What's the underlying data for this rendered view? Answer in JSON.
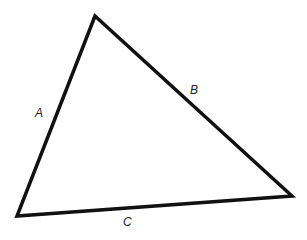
{
  "diagram": {
    "type": "triangle",
    "stroke_color": "#111111",
    "vertices": {
      "top": [
        95,
        16
      ],
      "bottom_left": [
        17,
        216
      ],
      "right": [
        292,
        196
      ]
    },
    "sides": [
      {
        "label": "A",
        "between": [
          "bottom_left",
          "top"
        ],
        "label_pos": [
          39,
          117
        ]
      },
      {
        "label": "B",
        "between": [
          "top",
          "right"
        ],
        "label_pos": [
          194,
          94
        ]
      },
      {
        "label": "C",
        "between": [
          "bottom_left",
          "right"
        ],
        "label_pos": [
          127,
          226
        ]
      }
    ]
  }
}
